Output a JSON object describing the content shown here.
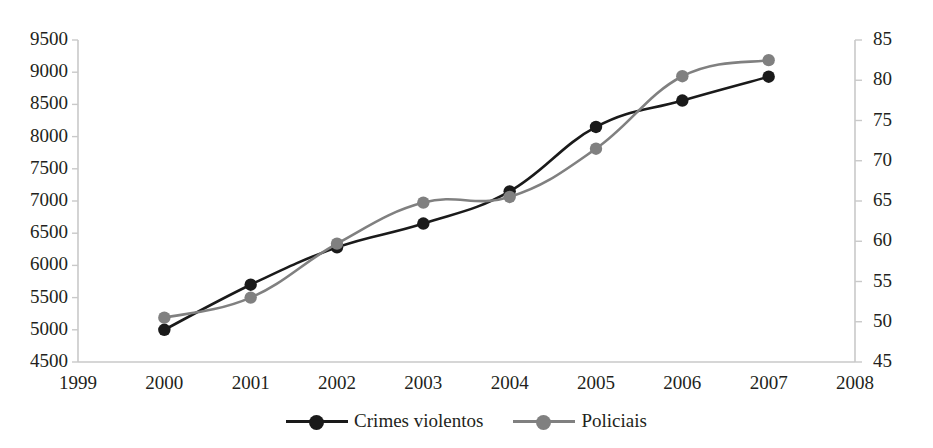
{
  "caption_fragment": "",
  "chart_data": {
    "type": "line",
    "title": "",
    "xlabel": "",
    "ylabel": "",
    "x": [
      2000,
      2001,
      2002,
      2003,
      2004,
      2005,
      2006,
      2007
    ],
    "xlim": [
      1999,
      2008
    ],
    "x_ticks": [
      "1999",
      "2000",
      "2001",
      "2002",
      "2003",
      "2004",
      "2005",
      "2006",
      "2007",
      "2008"
    ],
    "grid": false,
    "legend_position": "bottom",
    "axes": {
      "left": {
        "ylim": [
          4500,
          9500
        ],
        "ticks": [
          "9500",
          "9000",
          "8500",
          "8000",
          "7500",
          "7000",
          "6500",
          "6000",
          "5500",
          "5000",
          "4500"
        ],
        "tick_values": [
          9500,
          9000,
          8500,
          8000,
          7500,
          7000,
          6500,
          6000,
          5500,
          5000,
          4500
        ]
      },
      "right": {
        "ylim": [
          45,
          85
        ],
        "ticks": [
          "85",
          "80",
          "75",
          "70",
          "65",
          "60",
          "55",
          "50",
          "45"
        ],
        "tick_values": [
          85,
          80,
          75,
          70,
          65,
          60,
          55,
          50,
          45
        ]
      }
    },
    "series": [
      {
        "name": "Crimes violentos",
        "axis": "left",
        "color": "#1a1a1a",
        "marker": "circle",
        "values": [
          5000,
          5700,
          6280,
          6650,
          7150,
          8150,
          8560,
          8930
        ]
      },
      {
        "name": "Policiais",
        "axis": "right",
        "color": "#808080",
        "marker": "circle",
        "values": [
          50.5,
          53.0,
          59.7,
          64.8,
          65.5,
          71.5,
          80.5,
          82.5
        ]
      }
    ]
  },
  "legend": {
    "items": [
      {
        "label": "Crimes violentos",
        "color": "#1a1a1a"
      },
      {
        "label": "Policiais",
        "color": "#808080"
      }
    ]
  },
  "colors": {
    "series_primary": "#1a1a1a",
    "series_secondary": "#808080",
    "axis": "#bfbfbf",
    "text": "#231f20",
    "background": "#ffffff"
  }
}
